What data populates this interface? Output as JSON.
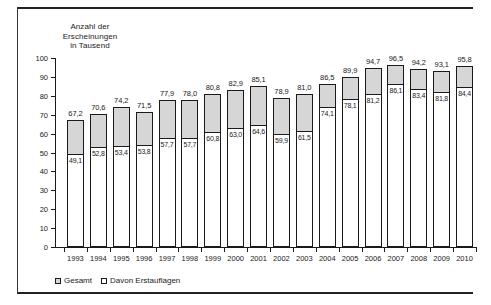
{
  "figure": {
    "axis_caption_lines": [
      "Anzahl der",
      "Erscheinungen",
      "in Tausend"
    ]
  },
  "legend": {
    "entries": [
      {
        "label": "Gesamt",
        "color": "#d6d6d6"
      },
      {
        "label": "Davon Erstauflagen",
        "color": "#ffffff"
      }
    ]
  },
  "chart_data": {
    "type": "bar",
    "title": "Anzahl der Erscheinungen in Tausend",
    "xlabel": "",
    "ylabel": "Anzahl der Erscheinungen in Tausend",
    "ylim": [
      0,
      100
    ],
    "yticks": [
      0,
      10,
      20,
      30,
      40,
      50,
      60,
      70,
      80,
      90,
      100
    ],
    "ytick_labels": [
      "0",
      "10",
      "20",
      "30",
      "40",
      "50",
      "60",
      "70",
      "80",
      "90",
      "100"
    ],
    "grid": false,
    "legend_position": "bottom-left",
    "stacked": true,
    "categories": [
      "1993",
      "1994",
      "1995",
      "1996",
      "1997",
      "1998",
      "1999",
      "2000",
      "2001",
      "2002",
      "2003",
      "2004",
      "2005",
      "2006",
      "2007",
      "2008",
      "2009",
      "2010"
    ],
    "series": [
      {
        "name": "Gesamt",
        "color": "#d6d6d6",
        "values": [
          67.2,
          70.6,
          74.2,
          71.5,
          77.9,
          78.0,
          80.8,
          82.9,
          85.1,
          78.9,
          81.0,
          86.5,
          89.9,
          94.7,
          96.5,
          94.2,
          93.1,
          95.8
        ],
        "labels": [
          "67,2",
          "70,6",
          "74,2",
          "71,5",
          "77,9",
          "78,0",
          "80,8",
          "82,9",
          "85,1",
          "78,9",
          "81,0",
          "86,5",
          "89,9",
          "94,7",
          "96,5",
          "94,2",
          "93,1",
          "95,8"
        ]
      },
      {
        "name": "Davon Erstauflagen",
        "color": "#ffffff",
        "values": [
          49.1,
          52.8,
          53.4,
          53.8,
          57.7,
          57.7,
          60.8,
          63.0,
          64.6,
          59.9,
          61.5,
          74.1,
          78.1,
          81.2,
          86.1,
          83.4,
          81.8,
          84.4
        ],
        "labels": [
          "49,1",
          "52,8",
          "53,4",
          "53,8",
          "57,7",
          "57,7",
          "60,8",
          "63,0",
          "64,6",
          "59,9",
          "61,5",
          "74,1",
          "78,1",
          "81,2",
          "86,1",
          "83,4",
          "81,8",
          "84,4"
        ]
      }
    ]
  }
}
